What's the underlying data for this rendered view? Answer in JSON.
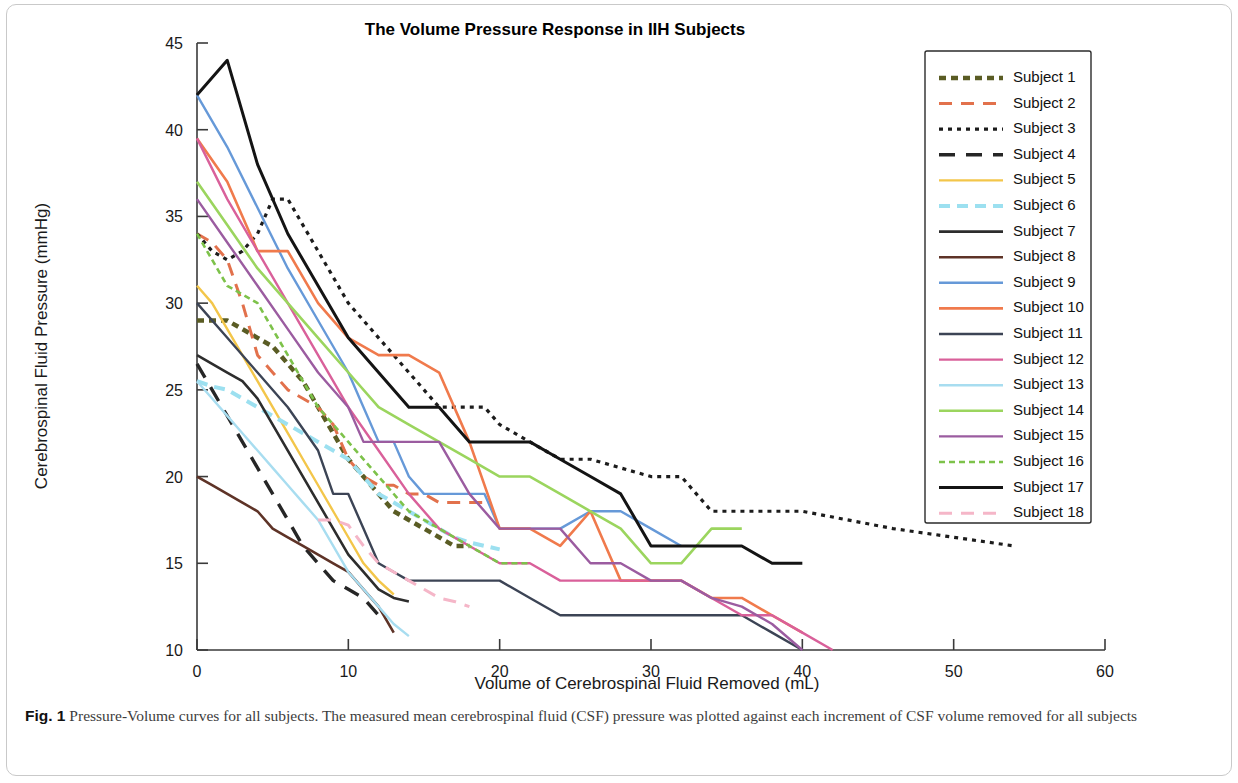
{
  "figure": {
    "caption_number": "Fig. 1",
    "caption_text": "Pressure-Volume curves for all subjects. The measured mean cerebrospinal fluid (CSF) pressure was plotted against each increment of CSF volume removed for all subjects"
  },
  "chart_data": {
    "type": "line",
    "title": "The Volume Pressure Response in IIH Subjects",
    "xlabel": "Volume of Cerebrospinal Fluid Removed (mL)",
    "ylabel": "Cerebrospinal Fluid Pressure (mmHg)",
    "xlim": [
      0,
      60
    ],
    "ylim": [
      10,
      45
    ],
    "xticks": [
      0,
      10,
      20,
      30,
      40,
      50,
      60
    ],
    "yticks": [
      10,
      15,
      20,
      25,
      30,
      35,
      40,
      45
    ],
    "grid": false,
    "legend_position": "upper right",
    "series": [
      {
        "name": "Subject 1",
        "color": "#5a5c24",
        "dash": "7,5",
        "width": 4.5,
        "x": [
          0,
          1,
          2,
          3,
          4,
          5,
          6,
          7,
          8,
          9,
          10,
          11,
          12,
          13,
          14,
          15,
          16,
          17,
          18
        ],
        "y": [
          29,
          29,
          29,
          28.5,
          28,
          27.5,
          26.5,
          25.5,
          24,
          22.5,
          21,
          20,
          19,
          18,
          17.5,
          17,
          16.5,
          16,
          16
        ]
      },
      {
        "name": "Subject 2",
        "color": "#e2714c",
        "dash": "13,9",
        "width": 3,
        "x": [
          0,
          1,
          2,
          3,
          4,
          5,
          6,
          7,
          8,
          9,
          10,
          11,
          12,
          13,
          14,
          15,
          16,
          17,
          18,
          19
        ],
        "y": [
          34,
          33.5,
          32.5,
          30,
          27,
          26,
          25,
          24.5,
          24,
          23,
          21,
          20,
          19.5,
          19.5,
          19,
          19,
          18.5,
          18.5,
          18.5,
          18.5
        ]
      },
      {
        "name": "Subject 3",
        "color": "#1c1c1c",
        "dash": "4,5",
        "width": 3.2,
        "x": [
          0,
          1,
          2,
          3,
          4,
          5,
          6,
          7,
          8,
          9,
          10,
          11,
          12,
          13,
          14,
          15,
          16,
          17,
          18,
          19,
          20,
          22,
          24,
          26,
          28,
          30,
          32,
          34,
          40,
          46,
          54
        ],
        "y": [
          34,
          33,
          32.5,
          33,
          34,
          36,
          36,
          34.5,
          33,
          31.5,
          30,
          29,
          28,
          27,
          26,
          25,
          24,
          24,
          24,
          24,
          23,
          22,
          21,
          21,
          20.5,
          20,
          20,
          18,
          18,
          17,
          16
        ]
      },
      {
        "name": "Subject 4",
        "color": "#262626",
        "dash": "16,11",
        "width": 3.4,
        "x": [
          0,
          1,
          2,
          3,
          4,
          5,
          6,
          7,
          8,
          9,
          10,
          11,
          12
        ],
        "y": [
          26.5,
          25,
          23.5,
          22,
          20.5,
          19,
          17.5,
          16,
          15,
          14,
          13.5,
          13,
          12
        ]
      },
      {
        "name": "Subject 5",
        "color": "#f3c64a",
        "dash": "none",
        "width": 2.4,
        "x": [
          0,
          1,
          2,
          3,
          4,
          5,
          6,
          7,
          8,
          9,
          10,
          11,
          12,
          13
        ],
        "y": [
          31,
          30,
          28.5,
          27,
          25.5,
          24,
          22.5,
          21,
          19.5,
          18,
          16.5,
          15,
          14,
          13.2
        ]
      },
      {
        "name": "Subject 6",
        "color": "#9ce0f0",
        "dash": "11,7",
        "width": 4,
        "x": [
          0,
          1,
          2,
          3,
          4,
          5,
          6,
          7,
          8,
          9,
          10,
          11,
          12,
          13,
          14,
          15,
          16,
          17,
          18,
          19,
          20
        ],
        "y": [
          25.5,
          25.2,
          25,
          24.5,
          24,
          23.5,
          23,
          22.5,
          22,
          21.5,
          21,
          20,
          19,
          18.5,
          18,
          17.5,
          17,
          16.5,
          16.2,
          16,
          15.8
        ]
      },
      {
        "name": "Subject 7",
        "color": "#2d2d2d",
        "dash": "none",
        "width": 2.6,
        "x": [
          0,
          1,
          2,
          3,
          4,
          5,
          6,
          7,
          8,
          9,
          10,
          11,
          12,
          13,
          14
        ],
        "y": [
          27,
          26.5,
          26,
          25.5,
          24.5,
          23,
          21.5,
          20,
          18.5,
          17,
          15.5,
          14.5,
          13.5,
          13,
          12.8
        ]
      },
      {
        "name": "Subject 8",
        "color": "#5e3327",
        "dash": "none",
        "width": 2.6,
        "x": [
          0,
          1,
          2,
          3,
          4,
          5,
          6,
          7,
          8,
          9,
          10,
          11,
          12,
          13
        ],
        "y": [
          20,
          19.5,
          19,
          18.5,
          18,
          17,
          16.5,
          16,
          15.5,
          15,
          14.5,
          13.5,
          12.5,
          11
        ]
      },
      {
        "name": "Subject 9",
        "color": "#6699d8",
        "dash": "none",
        "width": 2.4,
        "x": [
          0,
          2,
          4,
          6,
          8,
          10,
          11,
          12,
          13,
          14,
          15,
          16,
          17,
          18,
          19,
          20,
          22,
          24,
          26,
          28,
          30,
          32
        ],
        "y": [
          42,
          39,
          35.5,
          32,
          29,
          26,
          24,
          22,
          22,
          20,
          19,
          19,
          19,
          19,
          19,
          17,
          17,
          17,
          18,
          18,
          17,
          16
        ]
      },
      {
        "name": "Subject 10",
        "color": "#f07a4c",
        "dash": "none",
        "width": 2.6,
        "x": [
          0,
          2,
          4,
          6,
          8,
          10,
          12,
          14,
          16,
          18,
          20,
          22,
          24,
          25,
          26,
          27,
          28,
          30,
          32,
          34,
          36,
          38,
          40
        ],
        "y": [
          39.5,
          37,
          33,
          33,
          30,
          28,
          27,
          27,
          26,
          22,
          17,
          17,
          16,
          17,
          18,
          16,
          14,
          14,
          14,
          13,
          13,
          12,
          11
        ]
      },
      {
        "name": "Subject 11",
        "color": "#3c4455",
        "dash": "none",
        "width": 2.4,
        "x": [
          0,
          2,
          4,
          6,
          8,
          9,
          10,
          11,
          12,
          13,
          14,
          16,
          18,
          20,
          22,
          24,
          30,
          32,
          34,
          36,
          38,
          40
        ],
        "y": [
          30,
          28,
          26,
          24,
          21.5,
          19,
          19,
          17,
          15,
          14.5,
          14,
          14,
          14,
          14,
          13,
          12,
          12,
          12,
          12,
          12,
          11,
          10
        ]
      },
      {
        "name": "Subject 12",
        "color": "#d9609a",
        "dash": "none",
        "width": 2.4,
        "x": [
          0,
          2,
          4,
          6,
          8,
          10,
          12,
          14,
          16,
          18,
          20,
          22,
          24,
          26,
          28,
          30,
          32,
          34,
          36,
          38,
          40,
          42
        ],
        "y": [
          39.5,
          36,
          33,
          30,
          27,
          24,
          21.5,
          19,
          17,
          16,
          15,
          15,
          14,
          14,
          14,
          14,
          14,
          13,
          12,
          12,
          11,
          10
        ]
      },
      {
        "name": "Subject 13",
        "color": "#a8ddf0",
        "dash": "none",
        "width": 2.4,
        "x": [
          0,
          1,
          2,
          3,
          4,
          5,
          6,
          7,
          8,
          9,
          10,
          11,
          12,
          13,
          14
        ],
        "y": [
          25.5,
          24.5,
          23.5,
          22.5,
          21.5,
          20.5,
          19.5,
          18.5,
          17.5,
          16,
          14.5,
          13.5,
          12.5,
          11.5,
          10.8
        ]
      },
      {
        "name": "Subject 14",
        "color": "#9bd55e",
        "dash": "none",
        "width": 2.6,
        "x": [
          0,
          2,
          4,
          6,
          8,
          10,
          12,
          14,
          16,
          18,
          20,
          22,
          24,
          26,
          28,
          30,
          32,
          34,
          36
        ],
        "y": [
          37,
          34.5,
          32,
          30,
          28,
          26,
          24,
          23,
          22,
          21,
          20,
          20,
          19,
          18,
          17,
          15,
          15,
          17,
          17
        ]
      },
      {
        "name": "Subject 15",
        "color": "#9b5ca0",
        "dash": "none",
        "width": 2.4,
        "x": [
          0,
          2,
          4,
          6,
          8,
          10,
          11,
          12,
          13,
          14,
          16,
          18,
          20,
          22,
          24,
          26,
          28,
          30,
          32,
          34,
          36,
          38,
          40
        ],
        "y": [
          36,
          33.5,
          31,
          28.5,
          26,
          24,
          22,
          22,
          22,
          22,
          22,
          19,
          17,
          17,
          17,
          15,
          15,
          14,
          14,
          13,
          12.5,
          11.5,
          10
        ]
      },
      {
        "name": "Subject 16",
        "color": "#7dc24a",
        "dash": "6,4",
        "width": 2.6,
        "x": [
          0,
          2,
          4,
          6,
          8,
          10,
          12,
          14,
          16,
          18,
          20,
          22
        ],
        "y": [
          34,
          31,
          30,
          27,
          24,
          22,
          20,
          18,
          17,
          16,
          15,
          15
        ]
      },
      {
        "name": "Subject 17",
        "color": "#141414",
        "dash": "none",
        "width": 3,
        "x": [
          0,
          2,
          4,
          6,
          8,
          10,
          12,
          14,
          16,
          18,
          20,
          22,
          24,
          26,
          28,
          30,
          32,
          34,
          36,
          38,
          40
        ],
        "y": [
          42,
          44,
          38,
          34,
          31,
          28,
          26,
          24,
          24,
          22,
          22,
          22,
          21,
          20,
          19,
          16,
          16,
          16,
          16,
          15,
          15
        ]
      },
      {
        "name": "Subject 18",
        "color": "#f5b6c8",
        "dash": "13,9",
        "width": 3,
        "x": [
          8,
          9,
          10,
          11,
          12,
          13,
          14,
          15,
          16,
          17,
          18
        ],
        "y": [
          17.5,
          17.5,
          17.2,
          16,
          15,
          14.5,
          14,
          13.5,
          13,
          12.8,
          12.5
        ]
      }
    ]
  }
}
